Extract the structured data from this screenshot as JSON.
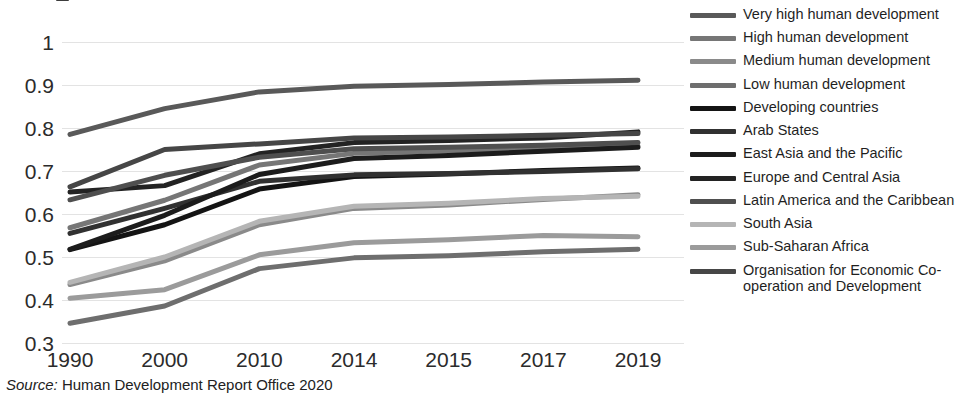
{
  "chart_data": {
    "type": "line",
    "title": "",
    "xlabel": "",
    "ylabel": "",
    "categories": [
      "1990",
      "2000",
      "2010",
      "2014",
      "2015",
      "2017",
      "2019"
    ],
    "ylim": [
      0.3,
      1.0
    ],
    "yticks": [
      "0.3",
      "0.4",
      "0.5",
      "0.6",
      "0.7",
      "0.8",
      "0.9",
      "1"
    ],
    "ytick_values": [
      0.3,
      0.4,
      0.5,
      0.6,
      0.7,
      0.8,
      0.9,
      1.0
    ],
    "grid": true,
    "legend_position": "right",
    "series": [
      {
        "name": "Very high human development",
        "color": "#595959",
        "width": 5,
        "values": [
          0.785,
          0.845,
          0.884,
          0.897,
          0.901,
          0.907,
          0.911
        ]
      },
      {
        "name": "High human development",
        "color": "#767676",
        "width": 5,
        "values": [
          0.568,
          0.632,
          0.714,
          0.741,
          0.747,
          0.753,
          0.758
        ]
      },
      {
        "name": "Medium human development",
        "color": "#8a8a8a",
        "width": 5,
        "values": [
          0.436,
          0.491,
          0.575,
          0.613,
          0.621,
          0.634,
          0.645
        ]
      },
      {
        "name": "Low human development",
        "color": "#6e6e6e",
        "width": 5,
        "values": [
          0.346,
          0.386,
          0.473,
          0.498,
          0.503,
          0.512,
          0.518
        ]
      },
      {
        "name": "Developing countries",
        "color": "#141414",
        "width": 5,
        "values": [
          0.517,
          0.575,
          0.658,
          0.687,
          0.693,
          0.701,
          0.707
        ]
      },
      {
        "name": "Arab States",
        "color": "#313131",
        "width": 5,
        "values": [
          0.555,
          0.613,
          0.676,
          0.691,
          0.694,
          0.699,
          0.705
        ]
      },
      {
        "name": "East Asia and the Pacific",
        "color": "#1c1c1c",
        "width": 5,
        "values": [
          0.518,
          0.597,
          0.692,
          0.729,
          0.736,
          0.746,
          0.755
        ]
      },
      {
        "name": "Europe and Central Asia",
        "color": "#232323",
        "width": 5,
        "values": [
          0.651,
          0.666,
          0.74,
          0.766,
          0.771,
          0.777,
          0.791
        ]
      },
      {
        "name": "Latin America and the Caribbean",
        "color": "#4f4f4f",
        "width": 5,
        "values": [
          0.633,
          0.69,
          0.732,
          0.752,
          0.755,
          0.76,
          0.766
        ]
      },
      {
        "name": "South Asia",
        "color": "#b5b5b5",
        "width": 5,
        "values": [
          0.441,
          0.5,
          0.583,
          0.618,
          0.625,
          0.636,
          0.641
        ]
      },
      {
        "name": "Sub-Saharan Africa",
        "color": "#9b9b9b",
        "width": 5,
        "values": [
          0.404,
          0.424,
          0.505,
          0.533,
          0.54,
          0.55,
          0.547
        ]
      },
      {
        "name": "Organisation for Economic Co-operation and Development",
        "color": "#464646",
        "width": 5,
        "values": [
          0.663,
          0.75,
          0.763,
          0.777,
          0.779,
          0.783,
          0.787
        ]
      }
    ]
  },
  "legend": {
    "items": [
      {
        "label": "Very high human development"
      },
      {
        "label": "High human development"
      },
      {
        "label": "Medium human development"
      },
      {
        "label": "Low human development"
      },
      {
        "label": "Developing countries"
      },
      {
        "label": "Arab States"
      },
      {
        "label": "East Asia and the Pacific"
      },
      {
        "label": "Europe and Central Asia"
      },
      {
        "label": "Latin America and the Caribbean"
      },
      {
        "label": "South Asia"
      },
      {
        "label": "Sub-Saharan Africa"
      },
      {
        "label": "Organisation for Economic Co-operation and Development"
      }
    ]
  },
  "source": {
    "prefix": "Source:",
    "text": "Human Development Report Office 2020"
  }
}
